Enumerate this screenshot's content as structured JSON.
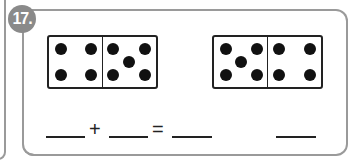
{
  "problem": {
    "number": "17.",
    "badge_color": "#8a8a8a",
    "dominoes": [
      {
        "left_pips": 4,
        "right_pips": 5
      },
      {
        "left_pips": 5,
        "right_pips": 4
      }
    ],
    "equation": {
      "plus": "+",
      "equals": "="
    }
  }
}
